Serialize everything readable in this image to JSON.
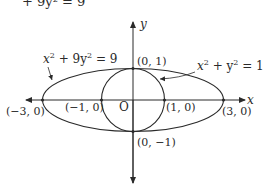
{
  "figure": {
    "top_caption_partial": "+ 9y² = 9",
    "axes": {
      "x_label": "x",
      "y_label": "y",
      "origin_label": "O"
    },
    "curves": [
      {
        "name": "ellipse",
        "equation": "x² + 9y² = 9",
        "eq_base_x": "x",
        "eq_rest": " + 9y",
        "eq_tail": " = 9",
        "semi_major": 3,
        "semi_minor": 1
      },
      {
        "name": "circle",
        "equation": "x² + y² = 1",
        "eq_base_x": "x",
        "eq_rest": " + y",
        "eq_tail": " = 1",
        "radius": 1
      }
    ],
    "points": [
      {
        "label": "(0, 1)",
        "x": 0,
        "y": 1
      },
      {
        "label": "(0, −1)",
        "x": 0,
        "y": -1
      },
      {
        "label": "(−3, 0)",
        "x": -3,
        "y": 0
      },
      {
        "label": "(−1, 0)",
        "x": -1,
        "y": 0
      },
      {
        "label": "(1, 0)",
        "x": 1,
        "y": 0
      },
      {
        "label": "(3, 0)",
        "x": 3,
        "y": 0
      }
    ],
    "colors": {
      "stroke": "#2a2a2a",
      "background": "#ffffff"
    }
  }
}
